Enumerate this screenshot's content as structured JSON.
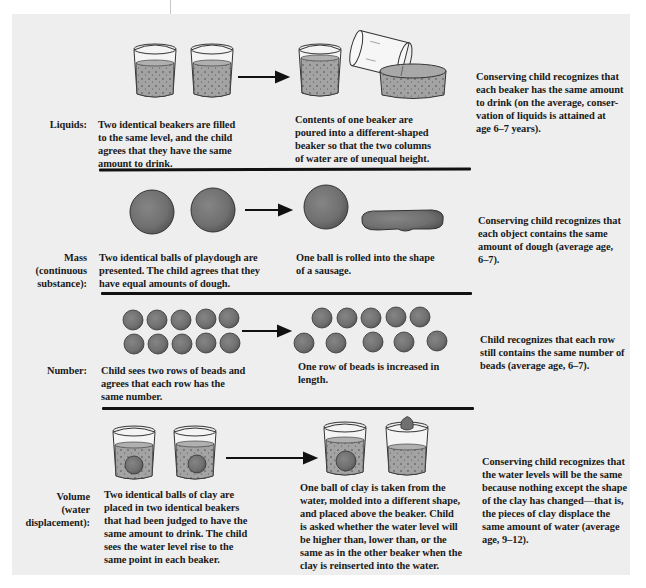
{
  "figure": {
    "colors": {
      "panel_bg": "#eeeeee",
      "water_fill": "#9c9c9c",
      "object_fill": "#6e6e6e",
      "divider": "#111111"
    },
    "rows": [
      {
        "id": "liquids",
        "label_lines": [
          "Liquids:"
        ],
        "initial_lines": [
          "Two identical beakers are filled",
          "to the same level, and the child",
          "agrees that they have the same",
          "amount to drink."
        ],
        "transformation_lines": [
          "Contents of one beaker are",
          "poured into a different-shaped",
          "beaker so that the two columns",
          "of water are of unequal height."
        ],
        "outcome_lines": [
          "Conserving child recognizes that",
          "each beaker has the same amount",
          "to drink (on the average, conser-",
          "vation of liquids is attained at",
          "age 6–7 years)."
        ]
      },
      {
        "id": "mass",
        "label_lines": [
          "Mass",
          "(continuous",
          "substance):"
        ],
        "initial_lines": [
          "Two identical balls of playdough are",
          "presented. The child agrees that they",
          "have equal amounts of dough."
        ],
        "transformation_lines": [
          "One ball is rolled into the shape",
          "of a sausage."
        ],
        "outcome_lines": [
          "Conserving child recognizes that",
          "each object contains the same",
          "amount of dough (average age,",
          "6–7)."
        ]
      },
      {
        "id": "number",
        "label_lines": [
          "Number:"
        ],
        "initial_lines": [
          "Child sees two rows of beads and",
          "agrees that each row has the",
          "same number."
        ],
        "transformation_lines": [
          "One row of beads is increased in",
          "length."
        ],
        "outcome_lines": [
          "Child recognizes that each row",
          "still contains the same number of",
          "beads (average age, 6–7)."
        ]
      },
      {
        "id": "volume",
        "label_lines": [
          "Volume",
          "(water",
          "displacement):"
        ],
        "initial_lines": [
          "Two identical balls of clay are",
          "placed in two identical beakers",
          "that had been judged to have the",
          "same amount to drink. The child",
          "sees the water level rise to the",
          "same point in each beaker."
        ],
        "transformation_lines": [
          "One ball of clay is taken from the",
          "water, molded into a different shape,",
          "and placed above the beaker. Child",
          "is asked whether the water level will",
          "be higher than, lower than, or the",
          "same as in the other beaker when the",
          "clay is reinserted into the water."
        ],
        "outcome_lines": [
          "Conserving child recognizes that",
          "the water levels will be the same",
          "because nothing except the shape",
          "of the clay has changed—that is,",
          "the pieces of clay displace the",
          "same amount of water (average",
          "age, 9–12)."
        ]
      }
    ],
    "icons": {
      "beaker": "beaker-icon",
      "arrow": "arrow-right-icon",
      "dough_ball": "dough-ball-icon",
      "sausage": "dough-sausage-icon",
      "bead": "bead-icon",
      "wide_dish": "wide-beaker-icon",
      "clay": "clay-ball-icon"
    }
  }
}
